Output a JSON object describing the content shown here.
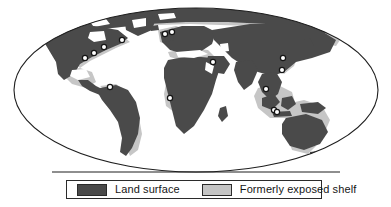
{
  "figure": {
    "type": "world-map",
    "projection": "mollweide-oval",
    "background_color": "#ffffff",
    "outline_color": "#1e1e1e",
    "title": ""
  },
  "map": {
    "land_color": "#4a4a4a",
    "shelf_color": "#c6c6c6",
    "ocean_color": "#ffffff",
    "border_color": "#1e1e1e",
    "baseline_note": "horizontal line truncating lower part of the oval",
    "marker": {
      "name": "site-marker",
      "fill_color": "#ffffff",
      "stroke_color": "#151515",
      "shape": "open-circle",
      "count": 14
    }
  },
  "legend": {
    "border_color": "#2b2b2b",
    "background_color": "#ffffff",
    "entries": [
      {
        "label": "Land surface",
        "swatch_color": "#4a4a4a",
        "swatch_name": "land-surface-swatch"
      },
      {
        "label": "Formerly exposed shelf",
        "swatch_color": "#c6c6c6",
        "swatch_name": "formerly-exposed-shelf-swatch"
      }
    ]
  },
  "markers": [
    {
      "name": "marker-north-america-ne-1",
      "cx": 104,
      "cy": 47
    },
    {
      "name": "marker-north-america-ne-2",
      "cx": 94,
      "cy": 53
    },
    {
      "name": "marker-north-america-ne-3",
      "cx": 85,
      "cy": 58
    },
    {
      "name": "marker-north-america-ne-4",
      "cx": 122,
      "cy": 40
    },
    {
      "name": "marker-south-america-north",
      "cx": 110,
      "cy": 87
    },
    {
      "name": "marker-north-atlantic-europe-1",
      "cx": 165,
      "cy": 34
    },
    {
      "name": "marker-north-atlantic-europe-2",
      "cx": 172,
      "cy": 32
    },
    {
      "name": "marker-west-africa",
      "cx": 170,
      "cy": 98
    },
    {
      "name": "marker-arabian-sea",
      "cx": 213,
      "cy": 62
    },
    {
      "name": "marker-east-asia-1",
      "cx": 283,
      "cy": 58
    },
    {
      "name": "marker-east-asia-2",
      "cx": 282,
      "cy": 70
    },
    {
      "name": "marker-south-china-sea",
      "cx": 266,
      "cy": 89
    },
    {
      "name": "marker-sunda-shelf",
      "cx": 274,
      "cy": 110
    },
    {
      "name": "marker-java-sea",
      "cx": 277,
      "cy": 112
    }
  ]
}
